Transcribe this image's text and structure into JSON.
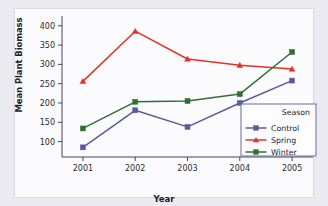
{
  "chart_data": {
    "type": "line",
    "title": "",
    "xlabel": "Year",
    "ylabel": "Mean Plant Biomass",
    "categories": [
      "2001",
      "2002",
      "2003",
      "2004",
      "2005"
    ],
    "x": [
      2001,
      2002,
      2003,
      2004,
      2005
    ],
    "xlim": [
      2000.6,
      2005.4
    ],
    "ylim": [
      60,
      415
    ],
    "yticks": [
      100,
      150,
      200,
      250,
      300,
      350,
      400
    ],
    "ytick_labels": [
      "100",
      "150",
      "200",
      "250",
      "300",
      "350",
      "400"
    ],
    "xtick_labels": [
      "2001",
      "2002",
      "2003",
      "2004",
      "2005"
    ],
    "grid": false,
    "legend_position": "lower-right",
    "legend_title": "Season",
    "series": [
      {
        "name": "Control",
        "color": "#5a5a9c",
        "marker": "square",
        "values": [
          85,
          181,
          138,
          200,
          258
        ]
      },
      {
        "name": "Spring",
        "color": "#e23228",
        "marker": "triangle",
        "values": [
          256,
          386,
          314,
          298,
          288
        ]
      },
      {
        "name": "Winter",
        "color": "#2e7030",
        "marker": "square",
        "values": [
          134,
          203,
          205,
          223,
          332
        ]
      }
    ]
  },
  "figure": {
    "background_color": "#eceaf1",
    "plot_background_color": "#fbfbfd",
    "axis_color": "#4a4458"
  }
}
